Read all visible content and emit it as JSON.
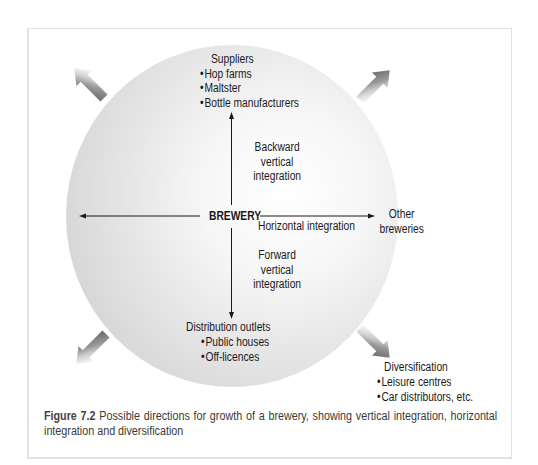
{
  "figure": {
    "center_label": "BREWERY",
    "up": {
      "heading": "Suppliers",
      "items": [
        "Hop farms",
        "Maltster",
        "Bottle manufacturers"
      ],
      "arrow_label": [
        "Backward",
        "vertical",
        "integration"
      ]
    },
    "down": {
      "heading": "Distribution outlets",
      "items": [
        "Public houses",
        "Off-licences"
      ],
      "arrow_label": [
        "Forward",
        "vertical",
        "integration"
      ]
    },
    "right": {
      "arrow_label": "Horizontal integration",
      "target": [
        "Other",
        "breweries"
      ]
    },
    "diversification": {
      "heading": "Diversification",
      "items": [
        "Leisure centres",
        "Car distributors, etc."
      ]
    },
    "diagonal_arrows": [
      "up-left",
      "up-right",
      "down-left",
      "down-right"
    ],
    "colors": {
      "circle_center": "#ffffff",
      "circle_edge": "#d6d6d6",
      "block_arrow_dark": "#5a5a5a",
      "line": "#1a1a1a",
      "frame_border": "#e2e2e2"
    }
  },
  "caption": {
    "figure_number": "Figure 7.2",
    "text": " Possible directions for growth of a brewery, showing vertical integration, horizontal integration and diversification"
  }
}
